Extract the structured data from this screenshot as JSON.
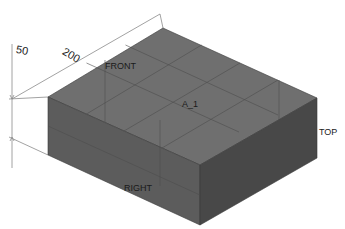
{
  "model": {
    "name": "A_1",
    "shape": "rectangular block (isometric view)",
    "colors": {
      "top_face": "#6f6f6f",
      "left_face": "#5c5c5c",
      "right_face": "#484848",
      "edge": "#3a3a3a",
      "grid": "#505050",
      "dimension_line": "#8a8a8a",
      "background": "#ffffff"
    }
  },
  "datum_planes": {
    "front": "FRONT",
    "top": "TOP",
    "right": "RIGHT"
  },
  "dimensions": {
    "width": "200",
    "height": "50"
  }
}
